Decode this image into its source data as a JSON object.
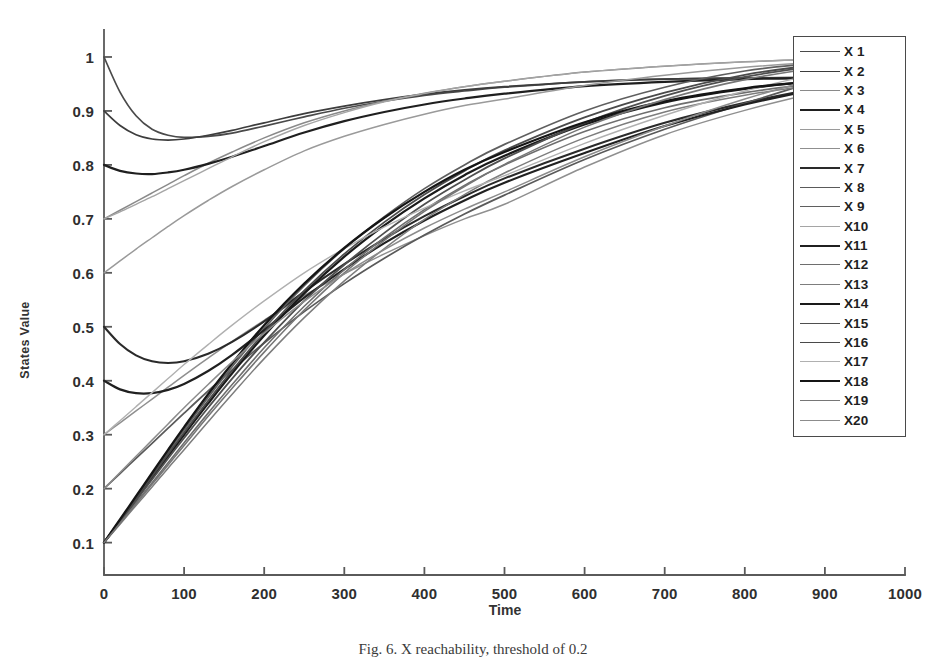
{
  "figure": {
    "caption": "Fig. 6.  X reachability, threshold of 0.2"
  },
  "chart_data": {
    "type": "line",
    "title": "",
    "xlabel": "Time",
    "ylabel": "States Value",
    "xlim": [
      0,
      1000
    ],
    "ylim": [
      0.04,
      1.05
    ],
    "xticks": [
      0,
      100,
      200,
      300,
      400,
      500,
      600,
      700,
      800,
      900,
      1000
    ],
    "xtick_labels": [
      "0",
      "100",
      "200",
      "300",
      "400",
      "500",
      "600",
      "700",
      "800",
      "900",
      "1000"
    ],
    "yticks": [
      0.1,
      0.2,
      0.3,
      0.4,
      0.5,
      0.6,
      0.7,
      0.8,
      0.9,
      1
    ],
    "ytick_labels": [
      "0.1",
      "0.2",
      "0.3",
      "0.4",
      "0.5",
      "0.6",
      "0.7",
      "0.8",
      "0.9",
      "1"
    ],
    "grid": false,
    "legend_position": "right-outside",
    "legend_entries": [
      "X 1",
      "X 2",
      "X 3",
      "X 4",
      "X 5",
      "X 6",
      "X 7",
      "X 8",
      "X 9",
      "X10",
      "X11",
      "X12",
      "X13",
      "X14",
      "X15",
      "X16",
      "X17",
      "X18",
      "X19",
      "X20"
    ],
    "x": [
      0,
      20,
      40,
      60,
      80,
      100,
      130,
      160,
      200,
      250,
      300,
      350,
      400,
      450,
      500,
      600,
      700,
      800,
      900,
      1000
    ],
    "series": [
      {
        "name": "X 1",
        "color": "#4a4a4a",
        "width": 1.7,
        "start": 1.0,
        "final": 0.963,
        "values": [
          1.0,
          0.935,
          0.891,
          0.866,
          0.855,
          0.851,
          0.853,
          0.859,
          0.872,
          0.889,
          0.905,
          0.918,
          0.929,
          0.937,
          0.944,
          0.954,
          0.959,
          0.961,
          0.962,
          0.963
        ]
      },
      {
        "name": "X 2",
        "color": "#3d3d3d",
        "width": 1.7,
        "start": 0.9,
        "final": 0.963,
        "values": [
          0.9,
          0.873,
          0.856,
          0.848,
          0.846,
          0.848,
          0.855,
          0.864,
          0.878,
          0.895,
          0.909,
          0.921,
          0.931,
          0.939,
          0.945,
          0.954,
          0.959,
          0.961,
          0.962,
          0.963
        ]
      },
      {
        "name": "X 3",
        "color": "#8a8a8a",
        "width": 1.5,
        "start": 0.7,
        "final": 1.0,
        "values": [
          0.7,
          0.716,
          0.732,
          0.748,
          0.764,
          0.78,
          0.803,
          0.824,
          0.85,
          0.878,
          0.9,
          0.918,
          0.933,
          0.945,
          0.955,
          0.972,
          0.983,
          0.991,
          0.996,
          1.0
        ]
      },
      {
        "name": "X 4",
        "color": "#1f1f1f",
        "width": 2.2,
        "start": 0.8,
        "final": 0.963,
        "values": [
          0.8,
          0.789,
          0.784,
          0.783,
          0.786,
          0.791,
          0.802,
          0.815,
          0.835,
          0.86,
          0.881,
          0.898,
          0.912,
          0.923,
          0.932,
          0.946,
          0.954,
          0.959,
          0.961,
          0.963
        ]
      },
      {
        "name": "X 5",
        "color": "#9a9a9a",
        "width": 1.5,
        "start": 0.6,
        "final": 1.0,
        "values": [
          0.6,
          0.622,
          0.644,
          0.665,
          0.686,
          0.706,
          0.734,
          0.76,
          0.791,
          0.826,
          0.853,
          0.875,
          0.894,
          0.91,
          0.922,
          0.947,
          0.966,
          0.981,
          0.991,
          1.0
        ]
      },
      {
        "name": "X 6",
        "color": "#8f8f8f",
        "width": 1.5,
        "start": 0.3,
        "final": 0.963,
        "values": [
          0.3,
          0.322,
          0.344,
          0.366,
          0.388,
          0.41,
          0.442,
          0.473,
          0.512,
          0.558,
          0.598,
          0.635,
          0.669,
          0.7,
          0.727,
          0.796,
          0.856,
          0.901,
          0.937,
          0.963
        ]
      },
      {
        "name": "X 7",
        "color": "#2a2a2a",
        "width": 2.1,
        "start": 0.5,
        "final": 0.963,
        "values": [
          0.5,
          0.468,
          0.447,
          0.436,
          0.433,
          0.436,
          0.45,
          0.472,
          0.51,
          0.565,
          0.616,
          0.663,
          0.705,
          0.742,
          0.775,
          0.83,
          0.878,
          0.915,
          0.944,
          0.963
        ]
      },
      {
        "name": "X 8",
        "color": "#5a5a5a",
        "width": 1.7,
        "start": 0.2,
        "final": 1.0,
        "values": [
          0.2,
          0.228,
          0.256,
          0.284,
          0.312,
          0.34,
          0.381,
          0.42,
          0.47,
          0.528,
          0.58,
          0.627,
          0.67,
          0.709,
          0.744,
          0.81,
          0.866,
          0.914,
          0.96,
          1.0
        ]
      },
      {
        "name": "X 9",
        "color": "#5f5f5f",
        "width": 1.7,
        "start": 0.1,
        "final": 1.0,
        "values": [
          0.1,
          0.142,
          0.184,
          0.226,
          0.268,
          0.309,
          0.369,
          0.426,
          0.497,
          0.576,
          0.645,
          0.704,
          0.756,
          0.8,
          0.838,
          0.9,
          0.944,
          0.974,
          0.99,
          1.0
        ]
      },
      {
        "name": "X10",
        "color": "#a5a5a5",
        "width": 1.4,
        "start": 0.7,
        "final": 1.0,
        "values": [
          0.7,
          0.713,
          0.727,
          0.741,
          0.756,
          0.771,
          0.793,
          0.815,
          0.843,
          0.873,
          0.897,
          0.917,
          0.932,
          0.945,
          0.955,
          0.972,
          0.983,
          0.991,
          0.996,
          1.0
        ]
      },
      {
        "name": "X11",
        "color": "#202020",
        "width": 2.2,
        "start": 0.4,
        "final": 0.963,
        "values": [
          0.4,
          0.384,
          0.377,
          0.377,
          0.383,
          0.394,
          0.418,
          0.448,
          0.494,
          0.554,
          0.607,
          0.655,
          0.697,
          0.734,
          0.767,
          0.822,
          0.872,
          0.912,
          0.942,
          0.963
        ]
      },
      {
        "name": "X12",
        "color": "#6e6e6e",
        "width": 1.6,
        "start": 0.1,
        "final": 0.963,
        "values": [
          0.1,
          0.137,
          0.174,
          0.211,
          0.248,
          0.285,
          0.34,
          0.393,
          0.461,
          0.538,
          0.606,
          0.665,
          0.717,
          0.762,
          0.8,
          0.862,
          0.906,
          0.934,
          0.952,
          0.963
        ]
      },
      {
        "name": "X13",
        "color": "#7d7d7d",
        "width": 1.5,
        "start": 0.1,
        "final": 0.963,
        "values": [
          0.1,
          0.134,
          0.169,
          0.203,
          0.238,
          0.272,
          0.324,
          0.375,
          0.441,
          0.517,
          0.585,
          0.645,
          0.699,
          0.745,
          0.785,
          0.85,
          0.898,
          0.929,
          0.95,
          0.963
        ]
      },
      {
        "name": "X14",
        "color": "#1a1a1a",
        "width": 2.3,
        "start": 0.1,
        "final": 0.963,
        "values": [
          0.1,
          0.14,
          0.18,
          0.22,
          0.26,
          0.3,
          0.358,
          0.414,
          0.484,
          0.562,
          0.63,
          0.688,
          0.738,
          0.781,
          0.817,
          0.875,
          0.916,
          0.941,
          0.956,
          0.963
        ]
      },
      {
        "name": "X15",
        "color": "#4f4f4f",
        "width": 1.8,
        "start": 0.1,
        "final": 1.0,
        "values": [
          0.1,
          0.139,
          0.178,
          0.217,
          0.256,
          0.294,
          0.35,
          0.404,
          0.471,
          0.548,
          0.615,
          0.674,
          0.727,
          0.772,
          0.812,
          0.878,
          0.928,
          0.963,
          0.985,
          1.0
        ]
      },
      {
        "name": "X16",
        "color": "#4a4a4a",
        "width": 1.8,
        "start": 0.1,
        "final": 1.0,
        "values": [
          0.1,
          0.141,
          0.182,
          0.223,
          0.264,
          0.304,
          0.363,
          0.419,
          0.489,
          0.567,
          0.635,
          0.694,
          0.745,
          0.789,
          0.827,
          0.888,
          0.934,
          0.967,
          0.987,
          1.0
        ]
      },
      {
        "name": "X17",
        "color": "#b0b0b0",
        "width": 1.4,
        "start": 0.3,
        "final": 1.0,
        "values": [
          0.3,
          0.326,
          0.352,
          0.378,
          0.404,
          0.43,
          0.467,
          0.503,
          0.548,
          0.6,
          0.645,
          0.685,
          0.72,
          0.752,
          0.78,
          0.84,
          0.892,
          0.937,
          0.972,
          1.0
        ]
      },
      {
        "name": "X18",
        "color": "#151515",
        "width": 2.3,
        "start": 0.1,
        "final": 0.963,
        "values": [
          0.1,
          0.143,
          0.186,
          0.229,
          0.272,
          0.314,
          0.375,
          0.432,
          0.503,
          0.58,
          0.646,
          0.702,
          0.75,
          0.791,
          0.824,
          0.879,
          0.918,
          0.942,
          0.956,
          0.963
        ]
      },
      {
        "name": "X19",
        "color": "#767676",
        "width": 1.6,
        "start": 0.1,
        "final": 1.0,
        "values": [
          0.1,
          0.136,
          0.172,
          0.208,
          0.244,
          0.28,
          0.334,
          0.386,
          0.453,
          0.531,
          0.6,
          0.66,
          0.714,
          0.76,
          0.801,
          0.87,
          0.921,
          0.958,
          0.982,
          1.0
        ]
      },
      {
        "name": "X20",
        "color": "#8c8c8c",
        "width": 1.5,
        "start": 0.2,
        "final": 1.0,
        "values": [
          0.2,
          0.23,
          0.26,
          0.29,
          0.32,
          0.35,
          0.393,
          0.435,
          0.488,
          0.547,
          0.598,
          0.643,
          0.683,
          0.718,
          0.75,
          0.815,
          0.872,
          0.922,
          0.964,
          1.0
        ]
      }
    ]
  },
  "axes": {
    "colors": {
      "spine": "#5a5a5a",
      "text": "#2f2f2f"
    }
  }
}
